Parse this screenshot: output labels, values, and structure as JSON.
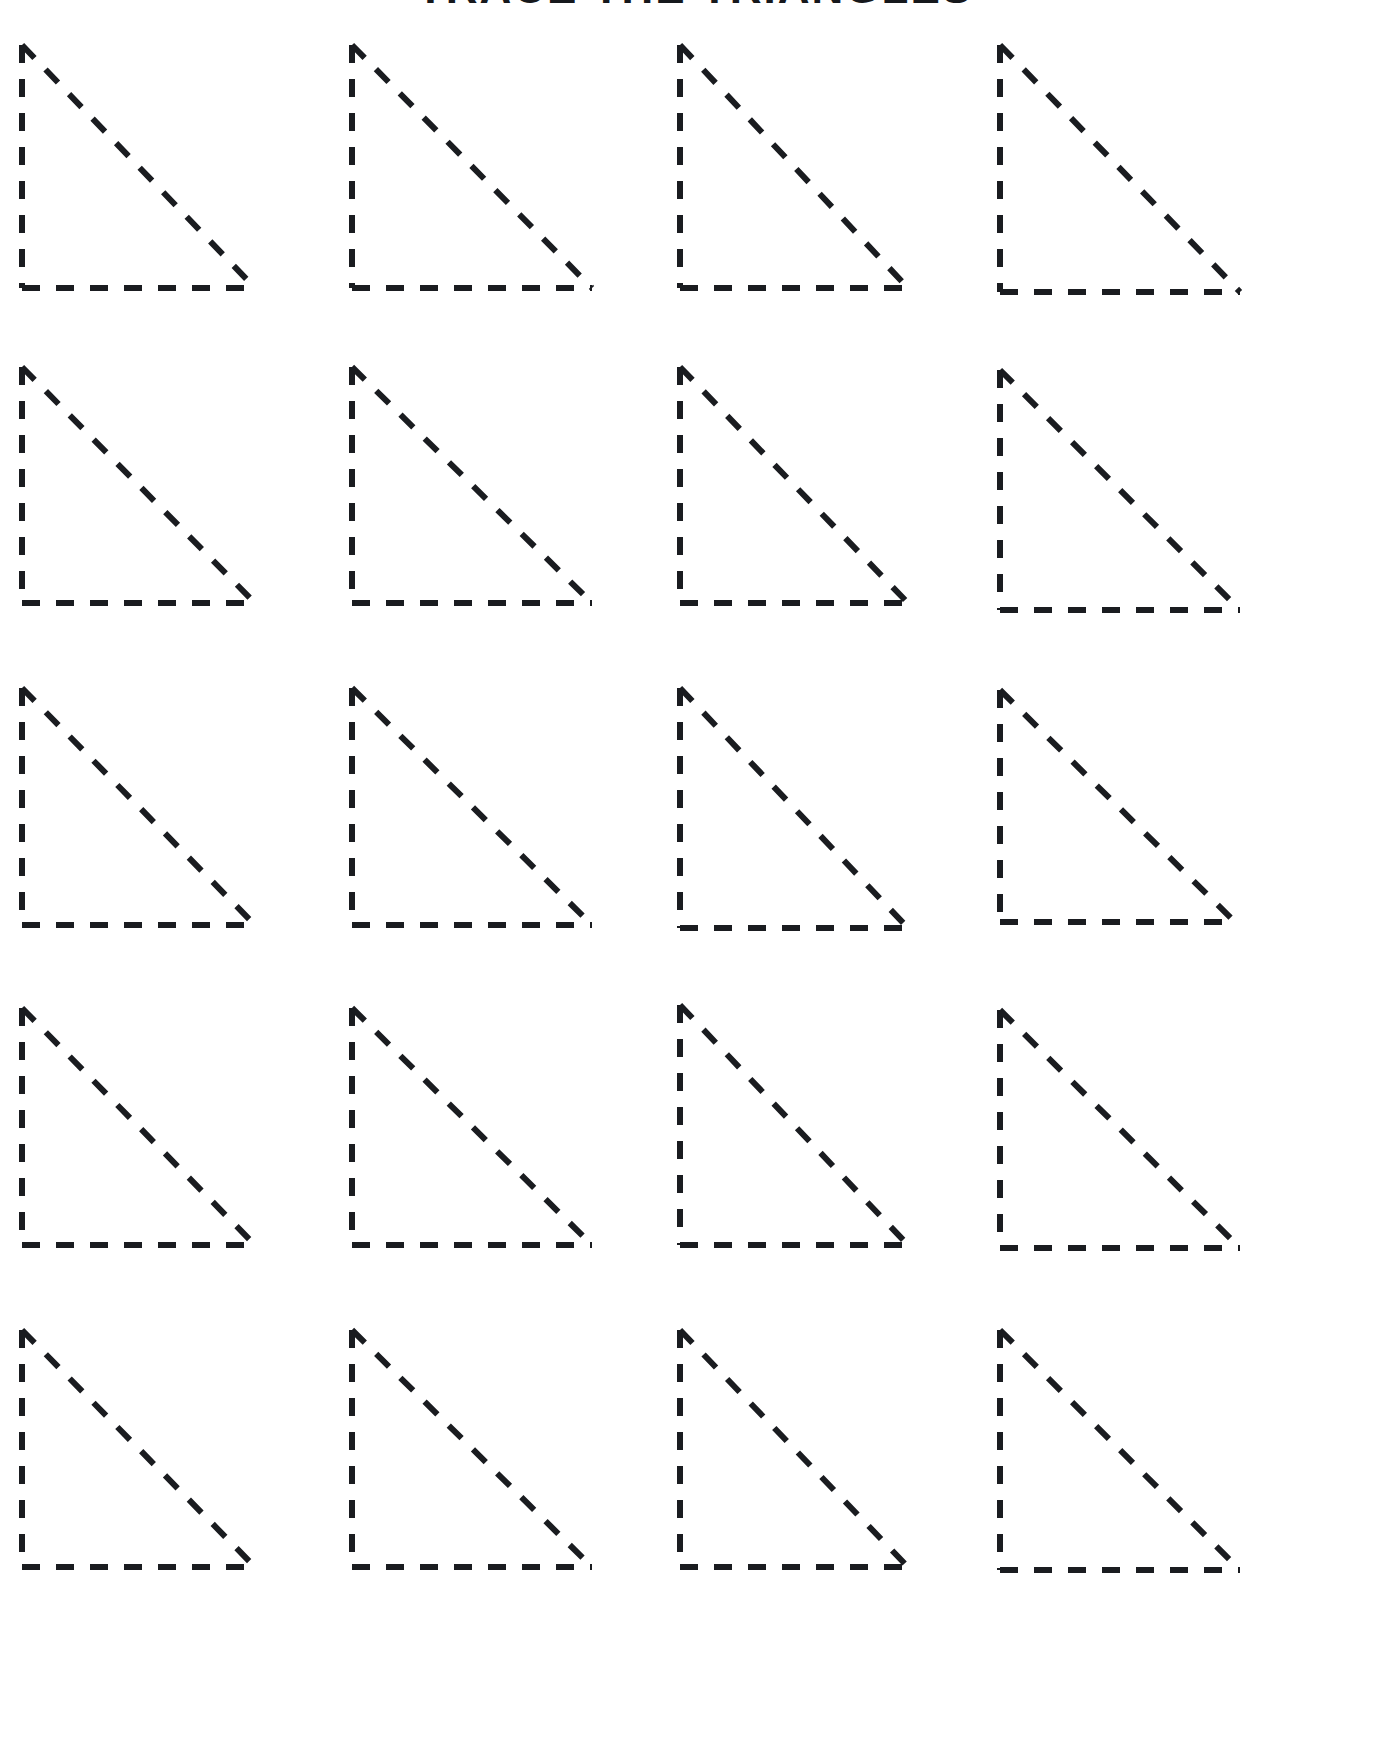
{
  "page": {
    "title": "TRACE THE TRIANGLES",
    "title_clipped": true,
    "background_color": "#ffffff",
    "width": 1390,
    "height": 1753,
    "kind": "tracing-worksheet"
  },
  "worksheet": {
    "shape_name": "triangle",
    "shape_type": "right-triangle",
    "stroke_color": "#1a1c20",
    "stroke_width": 6,
    "dash_pattern": "18 16",
    "columns": 4,
    "rows": 5,
    "last_row_clipped": true,
    "column_left_x": [
      22,
      352,
      680,
      1000
    ],
    "row_apex_y": [
      45,
      367,
      688,
      1008,
      1330
    ],
    "row_base_y": [
      288,
      608,
      930,
      1250,
      1572
    ],
    "triangles": [
      {
        "id": "r1c1",
        "row": 1,
        "col": 1,
        "apex_x": 22,
        "apex_y": 45,
        "base_y": 288,
        "base_right_x": 255
      },
      {
        "id": "r1c2",
        "row": 1,
        "col": 2,
        "apex_x": 352,
        "apex_y": 45,
        "base_y": 288,
        "base_right_x": 592
      },
      {
        "id": "r1c3",
        "row": 1,
        "col": 3,
        "apex_x": 680,
        "apex_y": 45,
        "base_y": 288,
        "base_right_x": 908
      },
      {
        "id": "r1c4",
        "row": 1,
        "col": 4,
        "apex_x": 1000,
        "apex_y": 45,
        "base_y": 292,
        "base_right_x": 1240
      },
      {
        "id": "r2c1",
        "row": 2,
        "col": 1,
        "apex_x": 22,
        "apex_y": 367,
        "base_y": 603,
        "base_right_x": 255
      },
      {
        "id": "r2c2",
        "row": 2,
        "col": 2,
        "apex_x": 352,
        "apex_y": 367,
        "base_y": 603,
        "base_right_x": 592
      },
      {
        "id": "r2c3",
        "row": 2,
        "col": 3,
        "apex_x": 680,
        "apex_y": 367,
        "base_y": 603,
        "base_right_x": 908
      },
      {
        "id": "r2c4",
        "row": 2,
        "col": 4,
        "apex_x": 1000,
        "apex_y": 370,
        "base_y": 610,
        "base_right_x": 1240
      },
      {
        "id": "r3c1",
        "row": 3,
        "col": 1,
        "apex_x": 22,
        "apex_y": 688,
        "base_y": 925,
        "base_right_x": 255
      },
      {
        "id": "r3c2",
        "row": 3,
        "col": 2,
        "apex_x": 352,
        "apex_y": 688,
        "base_y": 925,
        "base_right_x": 592
      },
      {
        "id": "r3c3",
        "row": 3,
        "col": 3,
        "apex_x": 680,
        "apex_y": 688,
        "base_y": 928,
        "base_right_x": 908
      },
      {
        "id": "r3c4",
        "row": 3,
        "col": 4,
        "apex_x": 1000,
        "apex_y": 690,
        "base_y": 922,
        "base_right_x": 1235
      },
      {
        "id": "r4c1",
        "row": 4,
        "col": 1,
        "apex_x": 22,
        "apex_y": 1008,
        "base_y": 1245,
        "base_right_x": 255
      },
      {
        "id": "r4c2",
        "row": 4,
        "col": 2,
        "apex_x": 352,
        "apex_y": 1008,
        "base_y": 1245,
        "base_right_x": 592
      },
      {
        "id": "r4c3",
        "row": 4,
        "col": 3,
        "apex_x": 680,
        "apex_y": 1005,
        "base_y": 1245,
        "base_right_x": 908
      },
      {
        "id": "r4c4",
        "row": 4,
        "col": 4,
        "apex_x": 1000,
        "apex_y": 1010,
        "base_y": 1248,
        "base_right_x": 1240
      },
      {
        "id": "r5c1",
        "row": 5,
        "col": 1,
        "apex_x": 22,
        "apex_y": 1330,
        "base_y": 1567,
        "base_right_x": 255
      },
      {
        "id": "r5c2",
        "row": 5,
        "col": 2,
        "apex_x": 352,
        "apex_y": 1330,
        "base_y": 1567,
        "base_right_x": 592
      },
      {
        "id": "r5c3",
        "row": 5,
        "col": 3,
        "apex_x": 680,
        "apex_y": 1330,
        "base_y": 1567,
        "base_right_x": 908
      },
      {
        "id": "r5c4",
        "row": 5,
        "col": 4,
        "apex_x": 1000,
        "apex_y": 1330,
        "base_y": 1570,
        "base_right_x": 1240
      }
    ]
  }
}
